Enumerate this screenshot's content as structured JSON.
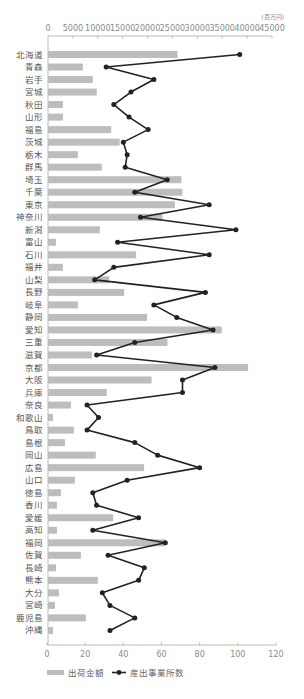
{
  "chart_data": {
    "type": "bar",
    "orientation": "horizontal",
    "title": "",
    "categories": [
      "北海道",
      "青森",
      "岩手",
      "宮城",
      "秋田",
      "山形",
      "福島",
      "茨城",
      "栃木",
      "群馬",
      "埼玉",
      "千葉",
      "東京",
      "神奈川",
      "新潟",
      "富山",
      "石川",
      "福井",
      "山梨",
      "長野",
      "岐阜",
      "静岡",
      "愛知",
      "三重",
      "滋賀",
      "京都",
      "大阪",
      "兵庫",
      "奈良",
      "和歌山",
      "鳥取",
      "島根",
      "岡山",
      "広島",
      "山口",
      "徳島",
      "香川",
      "愛媛",
      "高知",
      "福岡",
      "佐賀",
      "長崎",
      "熊本",
      "大分",
      "宮崎",
      "鹿児島",
      "沖縄"
    ],
    "series": [
      {
        "name": "出荷金額",
        "type": "bar",
        "axis": "top",
        "color": "#bdbdbd",
        "values": [
          26000,
          7000,
          9000,
          9800,
          3000,
          3000,
          12700,
          14400,
          6000,
          10800,
          26800,
          27000,
          25500,
          23000,
          10400,
          1600,
          17700,
          3000,
          12300,
          15300,
          6000,
          19900,
          34900,
          24000,
          8800,
          40200,
          20800,
          11800,
          4600,
          1000,
          5200,
          3400,
          9600,
          19300,
          5400,
          2600,
          1800,
          13100,
          1800,
          23500,
          6600,
          1600,
          10000,
          2200,
          1400,
          7600,
          1000
        ]
      },
      {
        "name": "産出事業所数",
        "type": "line",
        "axis": "bottom",
        "color": "#222222",
        "values": [
          101,
          31,
          56,
          44,
          35,
          43,
          53,
          40,
          42,
          41,
          63,
          46,
          85,
          49,
          99,
          37,
          85,
          35,
          25,
          83,
          56,
          68,
          87,
          46,
          26,
          88,
          71,
          71,
          21,
          27,
          21,
          46,
          58,
          80,
          42,
          24,
          26,
          48,
          24,
          62,
          32,
          51,
          48,
          29,
          33,
          46,
          33
        ]
      }
    ],
    "top_axis": {
      "unit": "(百万円)",
      "range": [
        0,
        45000
      ],
      "ticks": [
        "0",
        "5000",
        "10000",
        "15000",
        "20000",
        "25000",
        "30000",
        "35000",
        "40000",
        "45000"
      ]
    },
    "bottom_axis": {
      "range": [
        0,
        120
      ],
      "ticks": [
        "0",
        "20",
        "40",
        "60",
        "80",
        "100",
        "120"
      ]
    },
    "xlabel": "",
    "ylabel": "",
    "grid": false,
    "legend_position": "bottom-left"
  },
  "legend": {
    "bar_label": "出荷金額",
    "line_label": "産出事業所数"
  }
}
